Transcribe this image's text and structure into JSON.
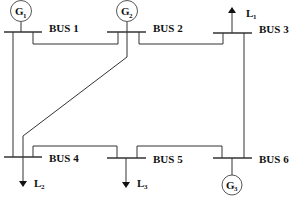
{
  "diagram": {
    "buses": [
      {
        "id": 1,
        "label": "BUS 1"
      },
      {
        "id": 2,
        "label": "BUS 2"
      },
      {
        "id": 3,
        "label": "BUS 3"
      },
      {
        "id": 4,
        "label": "BUS 4"
      },
      {
        "id": 5,
        "label": "BUS 5"
      },
      {
        "id": 6,
        "label": "BUS 6"
      }
    ],
    "generators": [
      {
        "id": "G1",
        "letter": "G",
        "sub": "1",
        "bus": 1
      },
      {
        "id": "G2",
        "letter": "G",
        "sub": "2",
        "bus": 2
      },
      {
        "id": "G3",
        "letter": "G",
        "sub": "3",
        "bus": 6
      }
    ],
    "loads": [
      {
        "id": "L1",
        "letter": "L",
        "sub": "1",
        "bus": 3,
        "direction": "up"
      },
      {
        "id": "L2",
        "letter": "L",
        "sub": "2",
        "bus": 4,
        "direction": "down"
      },
      {
        "id": "L3",
        "letter": "L",
        "sub": "3",
        "bus": 5,
        "direction": "down"
      }
    ],
    "lines": [
      {
        "from": 1,
        "to": 2
      },
      {
        "from": 1,
        "to": 4
      },
      {
        "from": 2,
        "to": 3
      },
      {
        "from": 2,
        "to": 4
      },
      {
        "from": 3,
        "to": 6
      },
      {
        "from": 4,
        "to": 5
      },
      {
        "from": 5,
        "to": 6
      }
    ]
  }
}
